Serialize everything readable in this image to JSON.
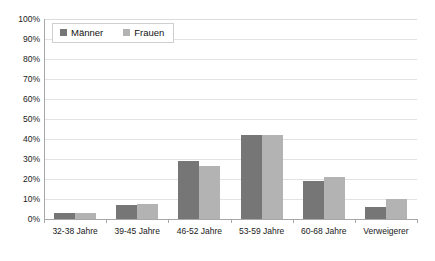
{
  "chart_data": {
    "type": "bar",
    "title": "",
    "subtitle": "",
    "xlabel": "",
    "ylabel": "",
    "ylim": [
      0,
      100
    ],
    "y_tick_labels": [
      "100%",
      "90%",
      "80%",
      "70%",
      "60%",
      "50%",
      "40%",
      "30%",
      "20%",
      "10%",
      "0%"
    ],
    "y_tick_values": [
      100,
      90,
      80,
      70,
      60,
      50,
      40,
      30,
      20,
      10,
      0
    ],
    "grid": true,
    "legend_position": "top-left",
    "categories": [
      "32-38 Jahre",
      "39-45 Jahre",
      "46-52 Jahre",
      "53-59 Jahre",
      "60-68 Jahre",
      "Verweigerer"
    ],
    "series": [
      {
        "name": "Männer",
        "color": "#767676",
        "values": [
          3,
          7,
          29,
          42,
          19,
          6
        ]
      },
      {
        "name": "Frauen",
        "color": "#b3b3b3",
        "values": [
          3,
          7.5,
          26.5,
          42,
          21,
          10
        ]
      }
    ]
  },
  "colors": {
    "maenner": "#767676",
    "frauen": "#b3b3b3",
    "grid": "#e3e3e3",
    "axis": "#a8a8a8",
    "text": "#1a1a1a",
    "background": "#ffffff"
  }
}
